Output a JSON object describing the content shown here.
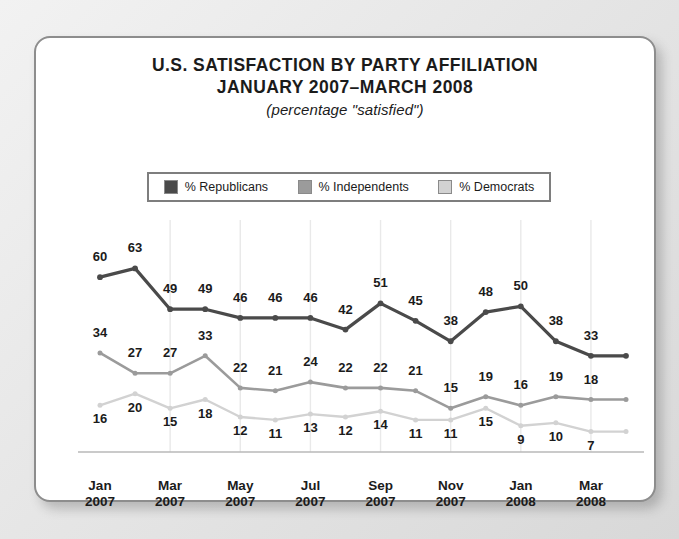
{
  "card": {
    "title_line1": "U.S. SATISFACTION BY PARTY AFFILIATION",
    "title_line2": "JANUARY 2007–MARCH 2008",
    "subtitle": "(percentage \"satisfied\")"
  },
  "legend": {
    "items": [
      {
        "label": "% Republicans",
        "color": "#4a4a4a"
      },
      {
        "label": "% Independents",
        "color": "#9b9b9b"
      },
      {
        "label": "% Democrats",
        "color": "#d2d2d2"
      }
    ]
  },
  "chart_data": {
    "type": "line",
    "title": "U.S. SATISFACTION BY PARTY AFFILIATION JANUARY 2007–MARCH 2008",
    "subtitle": "(percentage \"satisfied\")",
    "xlabel": "",
    "ylabel": "",
    "ylim": [
      0,
      70
    ],
    "grid": "vertical",
    "legend_position": "top-center",
    "x": [
      "Jan 2007",
      "Feb 2007",
      "Mar 2007",
      "Apr 2007",
      "May 2007",
      "Jun 2007",
      "Jul 2007",
      "Aug 2007",
      "Sep 2007",
      "Oct 2007",
      "Nov 2007",
      "Dec 2007",
      "Jan 2008",
      "Feb 2008",
      "Mar 2008",
      "Apr 2008"
    ],
    "tick_labels": [
      {
        "line1": "Jan",
        "line2": "2007",
        "index": 0
      },
      {
        "line1": "Mar",
        "line2": "2007",
        "index": 2
      },
      {
        "line1": "May",
        "line2": "2007",
        "index": 4
      },
      {
        "line1": "Jul",
        "line2": "2007",
        "index": 6
      },
      {
        "line1": "Sep",
        "line2": "2007",
        "index": 8
      },
      {
        "line1": "Nov",
        "line2": "2007",
        "index": 10
      },
      {
        "line1": "Jan",
        "line2": "2008",
        "index": 12
      },
      {
        "line1": "Mar",
        "line2": "2008",
        "index": 14
      }
    ],
    "series": [
      {
        "name": "% Republicans",
        "color": "#4a4a4a",
        "values": [
          60,
          63,
          49,
          49,
          46,
          46,
          46,
          42,
          51,
          45,
          38,
          48,
          50,
          38,
          33,
          33
        ]
      },
      {
        "name": "% Independents",
        "color": "#9b9b9b",
        "values": [
          34,
          27,
          27,
          33,
          22,
          21,
          24,
          22,
          22,
          21,
          15,
          19,
          16,
          19,
          18,
          18
        ]
      },
      {
        "name": "% Democrats",
        "color": "#d2d2d2",
        "values": [
          16,
          20,
          15,
          18,
          12,
          11,
          13,
          12,
          14,
          11,
          11,
          15,
          9,
          10,
          7,
          7
        ]
      }
    ],
    "label_offsets": {
      "rep": [
        -16,
        -16,
        -16,
        -16,
        -16,
        -16,
        -16,
        -16,
        -16,
        -16,
        -16,
        -16,
        -16,
        -16,
        -16,
        null
      ],
      "ind": [
        -16,
        -16,
        -16,
        -16,
        -16,
        -16,
        -16,
        -16,
        -16,
        -16,
        -16,
        -16,
        -16,
        -16,
        -16,
        null
      ],
      "dem": [
        18,
        18,
        18,
        18,
        18,
        18,
        18,
        18,
        18,
        18,
        18,
        18,
        18,
        18,
        18,
        null
      ]
    }
  }
}
